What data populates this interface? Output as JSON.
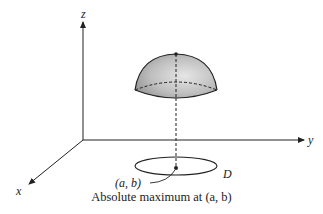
{
  "figure": {
    "axes": {
      "z_label": "z",
      "y_label": "y",
      "x_label": "x"
    },
    "region_label": "D",
    "point_label": "(a, b)",
    "caption": "Absolute maximum at (a, b)"
  },
  "colors": {
    "ink": "#222222",
    "dome_light": "#e8e8e8",
    "dome_dark": "#9a9a9a"
  }
}
